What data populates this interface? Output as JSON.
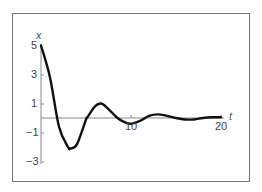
{
  "chart_data": {
    "type": "line",
    "title": "",
    "xlabel": "t",
    "ylabel": "x",
    "xlim": [
      0,
      20
    ],
    "ylim": [
      -3,
      5
    ],
    "x_ticks": [
      "10",
      "20"
    ],
    "y_ticks": [
      "5",
      "3",
      "1",
      "−1",
      "−3"
    ],
    "grid": false,
    "legend": null,
    "series": [
      {
        "name": "x(t) damped oscillation",
        "x": [
          0,
          1,
          2,
          3,
          3.3,
          4,
          5,
          5.1,
          6,
          6.6,
          7,
          8,
          8.5,
          9,
          9.9,
          11,
          12,
          13,
          14,
          15,
          16,
          17,
          18,
          19,
          20
        ],
        "values": [
          5,
          2.8,
          -0.6,
          -2.0,
          -2.1,
          -1.8,
          -0.1,
          0,
          0.8,
          1.0,
          0.9,
          0.3,
          0,
          -0.2,
          -0.4,
          -0.2,
          0.15,
          0.25,
          0.15,
          0,
          -0.1,
          -0.1,
          0,
          0.05,
          0.05
        ]
      }
    ]
  },
  "labels": {
    "ylabel": "x",
    "xlabel": "t",
    "yticks": [
      "5",
      "3",
      "1",
      "−1",
      "−3"
    ],
    "xticks": [
      "10",
      "20"
    ]
  }
}
